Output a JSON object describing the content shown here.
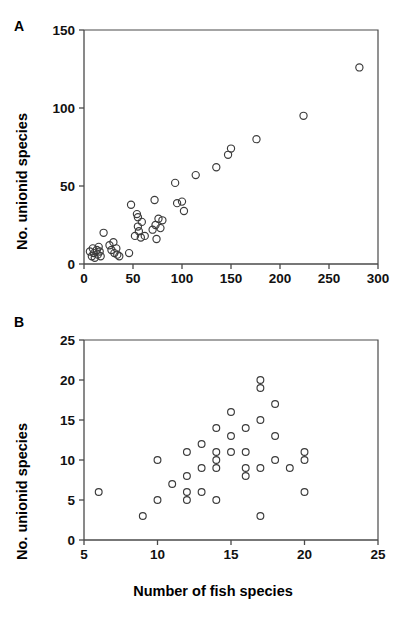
{
  "figure": {
    "panel_a_letter": "A",
    "panel_b_letter": "B",
    "shared_ylabel": "No. unionid species",
    "shared_xlabel_b": "Number of fish species"
  },
  "chart_data": [
    {
      "type": "scatter",
      "panel": "A",
      "title": "",
      "xlabel": "",
      "ylabel": "No. unionid species",
      "xlim": [
        0,
        300
      ],
      "ylim": [
        0,
        150
      ],
      "xticks": [
        0,
        50,
        100,
        150,
        200,
        250,
        300
      ],
      "yticks": [
        0,
        50,
        100,
        150
      ],
      "xticklabels": [
        "0",
        "50",
        "100",
        "150",
        "200",
        "250",
        "300"
      ],
      "yticklabels": [
        "0",
        "50",
        "100",
        "150"
      ],
      "grid": false,
      "legend": null,
      "marker": "open-circle",
      "points": [
        [
          6,
          8
        ],
        [
          8,
          5
        ],
        [
          9,
          10
        ],
        [
          10,
          7
        ],
        [
          11,
          4
        ],
        [
          13,
          9
        ],
        [
          14,
          6
        ],
        [
          15,
          11
        ],
        [
          16,
          8
        ],
        [
          17,
          5
        ],
        [
          20,
          20
        ],
        [
          26,
          12
        ],
        [
          28,
          9
        ],
        [
          30,
          14
        ],
        [
          31,
          7
        ],
        [
          33,
          10
        ],
        [
          34,
          6
        ],
        [
          36,
          5
        ],
        [
          46,
          7
        ],
        [
          48,
          38
        ],
        [
          52,
          18
        ],
        [
          54,
          32
        ],
        [
          55,
          30
        ],
        [
          55,
          24
        ],
        [
          56,
          21
        ],
        [
          58,
          17
        ],
        [
          59,
          27
        ],
        [
          62,
          18
        ],
        [
          70,
          22
        ],
        [
          72,
          41
        ],
        [
          73,
          25
        ],
        [
          74,
          16
        ],
        [
          76,
          29
        ],
        [
          78,
          23
        ],
        [
          80,
          28
        ],
        [
          93,
          52
        ],
        [
          95,
          39
        ],
        [
          100,
          40
        ],
        [
          102,
          34
        ],
        [
          114,
          57
        ],
        [
          135,
          62
        ],
        [
          147,
          70
        ],
        [
          150,
          74
        ],
        [
          176,
          80
        ],
        [
          224,
          95
        ],
        [
          281,
          126
        ]
      ]
    },
    {
      "type": "scatter",
      "panel": "B",
      "title": "",
      "xlabel": "Number of fish species",
      "ylabel": "No. unionid species",
      "xlim": [
        5,
        25
      ],
      "ylim": [
        0,
        25
      ],
      "xticks": [
        5,
        10,
        15,
        20,
        25
      ],
      "yticks": [
        0,
        5,
        10,
        15,
        20,
        25
      ],
      "xticklabels": [
        "5",
        "10",
        "15",
        "20",
        "25"
      ],
      "yticklabels": [
        "0",
        "5",
        "10",
        "15",
        "20",
        "25"
      ],
      "grid": false,
      "legend": null,
      "marker": "open-circle",
      "points": [
        [
          6,
          6
        ],
        [
          9,
          3
        ],
        [
          10,
          10
        ],
        [
          10,
          5
        ],
        [
          11,
          7
        ],
        [
          12,
          11
        ],
        [
          12,
          8
        ],
        [
          12,
          6
        ],
        [
          12,
          5
        ],
        [
          13,
          12
        ],
        [
          13,
          9
        ],
        [
          13,
          6
        ],
        [
          14,
          14
        ],
        [
          14,
          11
        ],
        [
          14,
          10
        ],
        [
          14,
          9
        ],
        [
          14,
          5
        ],
        [
          15,
          16
        ],
        [
          15,
          13
        ],
        [
          15,
          11
        ],
        [
          16,
          14
        ],
        [
          16,
          11
        ],
        [
          16,
          9
        ],
        [
          16,
          8
        ],
        [
          17,
          20
        ],
        [
          17,
          19
        ],
        [
          17,
          15
        ],
        [
          17,
          9
        ],
        [
          17,
          3
        ],
        [
          18,
          17
        ],
        [
          18,
          13
        ],
        [
          18,
          10
        ],
        [
          19,
          9
        ],
        [
          20,
          11
        ],
        [
          20,
          10
        ],
        [
          20,
          6
        ]
      ]
    }
  ]
}
